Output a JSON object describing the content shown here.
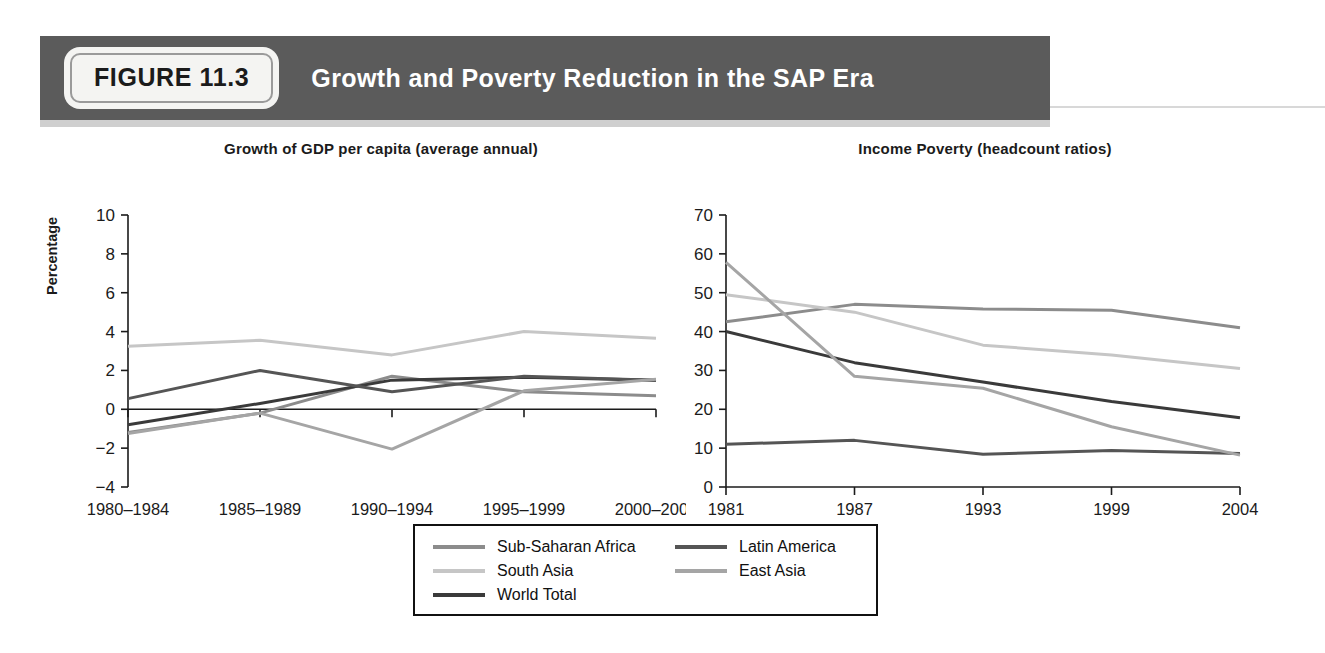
{
  "banner": {
    "figure_badge": "FIGURE 11.3",
    "title": "Growth and Poverty Reduction in the SAP Era"
  },
  "series_colors": {
    "sub_saharan_africa": "#8c8c8c",
    "south_asia": "#c6c6c6",
    "world_total": "#3a3a3a",
    "latin_america": "#555555",
    "east_asia": "#a5a5a5"
  },
  "legend": {
    "items": [
      {
        "label": "Sub-Saharan Africa",
        "color": "#8c8c8c"
      },
      {
        "label": "South Asia",
        "color": "#c6c6c6"
      },
      {
        "label": "World Total",
        "color": "#3a3a3a"
      },
      {
        "label": "Latin America",
        "color": "#555555"
      },
      {
        "label": "East Asia",
        "color": "#a5a5a5"
      }
    ]
  },
  "chart_data": [
    {
      "id": "growth",
      "type": "line",
      "title": "Growth of GDP per capita (average annual)",
      "xlabel": "",
      "ylabel": "Percentage",
      "categories": [
        "1980–1984",
        "1985–1989",
        "1990–1994",
        "1995–1999",
        "2000–2004"
      ],
      "ylim": [
        -4,
        10
      ],
      "yticks": [
        -4,
        -2,
        0,
        2,
        4,
        6,
        8,
        10
      ],
      "grid": false,
      "zero_line": true,
      "legend_position": "bottom-shared",
      "series": [
        {
          "name": "Sub-Saharan Africa",
          "color": "#8c8c8c",
          "values": [
            -1.2,
            -0.2,
            1.7,
            0.9,
            0.7
          ]
        },
        {
          "name": "South Asia",
          "color": "#c6c6c6",
          "values": [
            3.25,
            3.55,
            2.8,
            4.0,
            3.65
          ]
        },
        {
          "name": "World Total",
          "color": "#3a3a3a",
          "values": [
            -0.8,
            0.3,
            1.5,
            1.65,
            1.5
          ]
        },
        {
          "name": "Latin America",
          "color": "#555555",
          "values": [
            0.55,
            2.0,
            0.9,
            1.7,
            1.5
          ]
        },
        {
          "name": "East Asia",
          "color": "#a5a5a5",
          "values": [
            -1.25,
            -0.2,
            -2.05,
            0.95,
            1.55
          ]
        }
      ]
    },
    {
      "id": "poverty",
      "type": "line",
      "title": "Income Poverty (headcount ratios)",
      "xlabel": "",
      "ylabel": "",
      "categories": [
        "1981",
        "1987",
        "1993",
        "1999",
        "2004"
      ],
      "ylim": [
        0,
        70
      ],
      "yticks": [
        0,
        10,
        20,
        30,
        40,
        50,
        60,
        70
      ],
      "grid": false,
      "legend_position": "bottom-shared",
      "series": [
        {
          "name": "Sub-Saharan Africa",
          "color": "#8c8c8c",
          "values": [
            42.5,
            47.0,
            45.8,
            45.5,
            41.0
          ]
        },
        {
          "name": "South Asia",
          "color": "#c6c6c6",
          "values": [
            49.5,
            45.0,
            36.5,
            34.0,
            30.5
          ]
        },
        {
          "name": "World Total",
          "color": "#3a3a3a",
          "values": [
            40.0,
            32.0,
            27.0,
            22.0,
            17.8
          ]
        },
        {
          "name": "Latin America",
          "color": "#555555",
          "values": [
            11.0,
            12.0,
            8.4,
            9.4,
            8.6
          ]
        },
        {
          "name": "East Asia",
          "color": "#a5a5a5",
          "values": [
            57.8,
            28.5,
            25.4,
            15.5,
            8.2
          ]
        }
      ]
    }
  ]
}
